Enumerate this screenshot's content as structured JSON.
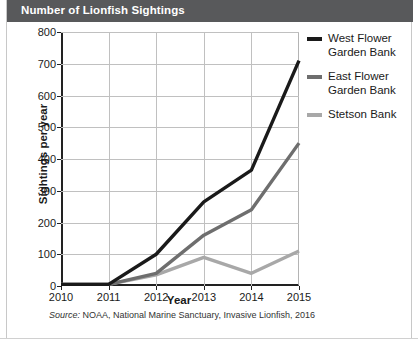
{
  "title": "Number of Lionfish Sightings",
  "caption": {
    "source_word": "Source:",
    "text": " NOAA, National Marine Sanctuary, Invasive Lionfish, 2016"
  },
  "colors": {
    "title_bar": "#58595b",
    "west_flower_garden_bank": "#1a1a1a",
    "east_flower_garden_bank": "#6e6e6e",
    "stetson_bank": "#a8a8a8",
    "gridline": "#c0c0c0",
    "axis": "#222222"
  },
  "legend": {
    "position": "right",
    "items": [
      {
        "label_line1": "West Flower",
        "label_line2": "Garden Bank",
        "color": "#1a1a1a"
      },
      {
        "label_line1": "East Flower",
        "label_line2": "Garden Bank",
        "color": "#6e6e6e"
      },
      {
        "label_line1": "Stetson Bank",
        "label_line2": "",
        "color": "#a8a8a8"
      }
    ]
  },
  "chart_data": {
    "type": "line",
    "title": "Number of Lionfish Sightings",
    "xlabel": "Year",
    "ylabel": "Sightings per year",
    "categories": [
      "2010",
      "2011",
      "2012",
      "2013",
      "2014",
      "2015"
    ],
    "x": [
      2010,
      2011,
      2012,
      2013,
      2014,
      2015
    ],
    "xlim": [
      2010,
      2015
    ],
    "ylim": [
      0,
      800
    ],
    "yticks": [
      0,
      100,
      200,
      300,
      400,
      500,
      600,
      700,
      800
    ],
    "xticks": [
      2010,
      2011,
      2012,
      2013,
      2014,
      2015
    ],
    "grid": true,
    "legend_position": "right",
    "series": [
      {
        "name": "West Flower Garden Bank",
        "color": "#1a1a1a",
        "values": [
          5,
          5,
          100,
          265,
          365,
          710
        ]
      },
      {
        "name": "East Flower Garden Bank",
        "color": "#6e6e6e",
        "values": [
          5,
          5,
          40,
          160,
          240,
          450
        ]
      },
      {
        "name": "Stetson Bank",
        "color": "#a8a8a8",
        "values": [
          5,
          5,
          35,
          90,
          40,
          110
        ]
      }
    ],
    "annotation": "Source: NOAA, National Marine Sanctuary, Invasive Lionfish, 2016"
  }
}
